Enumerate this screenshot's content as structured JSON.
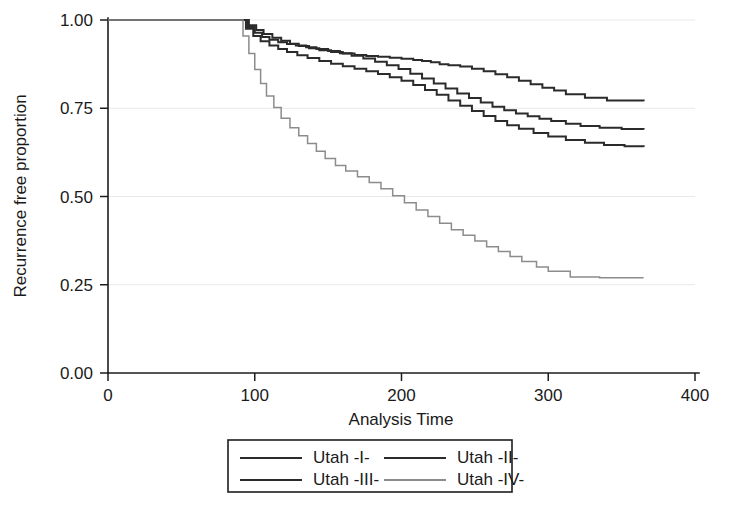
{
  "chart_data": {
    "type": "line",
    "title": "",
    "subtitle": "",
    "xlabel": "Analysis Time",
    "ylabel": "Recurrence free proportion",
    "xlim": [
      0,
      400
    ],
    "ylim": [
      0.0,
      1.0
    ],
    "xticks": [
      0,
      100,
      200,
      300,
      400
    ],
    "xticklabels": [
      "0",
      "100",
      "200",
      "300",
      "400"
    ],
    "yticks": [
      0.0,
      0.25,
      0.5,
      0.75,
      1.0
    ],
    "yticklabels": [
      "0.00",
      "0.25",
      "0.50",
      "0.75",
      "1.00"
    ],
    "grid": "horizontal",
    "legend_position": "bottom",
    "step_type": "post",
    "series": [
      {
        "name": "Utah -I-",
        "color": "#2b2b2b",
        "width": 2.0,
        "final_value": 0.77,
        "x": [
          0,
          90,
          96,
          101,
          106,
          112,
          118,
          124,
          130,
          137,
          144,
          152,
          160,
          168,
          176,
          184,
          192,
          200,
          208,
          214,
          220,
          226,
          232,
          240,
          248,
          256,
          264,
          272,
          280,
          288,
          296,
          304,
          312,
          325,
          340,
          365
        ],
        "y": [
          1.0,
          1.0,
          0.985,
          0.972,
          0.96,
          0.95,
          0.941,
          0.933,
          0.926,
          0.92,
          0.914,
          0.909,
          0.905,
          0.901,
          0.898,
          0.896,
          0.893,
          0.89,
          0.887,
          0.884,
          0.88,
          0.875,
          0.872,
          0.868,
          0.862,
          0.855,
          0.846,
          0.838,
          0.828,
          0.818,
          0.808,
          0.8,
          0.79,
          0.78,
          0.772,
          0.77
        ]
      },
      {
        "name": "Utah -II-",
        "color": "#2b2b2b",
        "width": 2.0,
        "final_value": 0.69,
        "x": [
          0,
          90,
          95,
          100,
          105,
          110,
          116,
          122,
          128,
          135,
          142,
          150,
          158,
          166,
          174,
          182,
          190,
          198,
          206,
          214,
          222,
          230,
          238,
          246,
          254,
          262,
          270,
          278,
          286,
          294,
          302,
          312,
          322,
          335,
          350,
          365
        ],
        "y": [
          1.0,
          1.0,
          0.98,
          0.964,
          0.952,
          0.944,
          0.937,
          0.932,
          0.928,
          0.923,
          0.918,
          0.912,
          0.906,
          0.899,
          0.891,
          0.882,
          0.872,
          0.861,
          0.848,
          0.834,
          0.82,
          0.806,
          0.792,
          0.779,
          0.766,
          0.754,
          0.744,
          0.735,
          0.727,
          0.72,
          0.714,
          0.706,
          0.7,
          0.695,
          0.691,
          0.69
        ]
      },
      {
        "name": "Utah -III-",
        "color": "#2b2b2b",
        "width": 2.0,
        "final_value": 0.64,
        "x": [
          0,
          90,
          94,
          99,
          104,
          110,
          116,
          122,
          129,
          136,
          144,
          152,
          160,
          168,
          176,
          184,
          192,
          200,
          208,
          216,
          224,
          232,
          240,
          248,
          256,
          264,
          272,
          280,
          290,
          300,
          312,
          325,
          338,
          352,
          365
        ],
        "y": [
          1.0,
          1.0,
          0.975,
          0.955,
          0.94,
          0.928,
          0.918,
          0.909,
          0.9,
          0.892,
          0.884,
          0.876,
          0.869,
          0.862,
          0.855,
          0.847,
          0.838,
          0.828,
          0.816,
          0.802,
          0.788,
          0.772,
          0.757,
          0.742,
          0.728,
          0.714,
          0.702,
          0.692,
          0.68,
          0.67,
          0.66,
          0.652,
          0.646,
          0.642,
          0.64
        ]
      },
      {
        "name": "Utah -IV-",
        "color": "#8c8c8c",
        "width": 1.5,
        "final_value": 0.27,
        "x": [
          0,
          88,
          92,
          96,
          100,
          104,
          108,
          113,
          118,
          124,
          130,
          136,
          142,
          148,
          155,
          162,
          170,
          178,
          186,
          194,
          202,
          210,
          218,
          226,
          234,
          242,
          250,
          258,
          266,
          274,
          282,
          292,
          300,
          315,
          335,
          365
        ],
        "y": [
          1.0,
          1.0,
          0.955,
          0.905,
          0.86,
          0.82,
          0.785,
          0.752,
          0.722,
          0.695,
          0.672,
          0.65,
          0.628,
          0.608,
          0.588,
          0.572,
          0.556,
          0.54,
          0.522,
          0.502,
          0.482,
          0.462,
          0.443,
          0.424,
          0.406,
          0.39,
          0.374,
          0.358,
          0.344,
          0.33,
          0.316,
          0.3,
          0.288,
          0.272,
          0.27,
          0.27
        ]
      }
    ]
  },
  "legend": {
    "entries": [
      {
        "label": "Utah -I-",
        "color": "#2b2b2b",
        "width": 2.0
      },
      {
        "label": "Utah -II-",
        "color": "#2b2b2b",
        "width": 2.0
      },
      {
        "label": "Utah -III-",
        "color": "#2b2b2b",
        "width": 2.0
      },
      {
        "label": "Utah -IV-",
        "color": "#8c8c8c",
        "width": 1.5
      }
    ]
  },
  "plot_geometry": {
    "left": 108,
    "right": 695,
    "top": 20,
    "bottom": 373,
    "curve_end_x": 365
  }
}
